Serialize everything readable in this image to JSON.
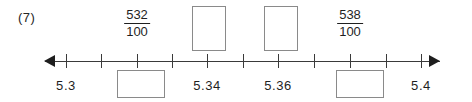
{
  "worksheet": {
    "problem_number": "(7)"
  },
  "number_line": {
    "axis": {
      "left_arrow_icon": "arrow-left-icon",
      "right_arrow_icon": "arrow-right-icon",
      "tick_count": 11,
      "start_value": "5.3",
      "end_value": "5.4",
      "tick_step": "0.01",
      "axis_color": "#3a3a3a"
    },
    "ticks": [
      {
        "index": 0,
        "x": 66
      },
      {
        "index": 1,
        "x": 101
      },
      {
        "index": 2,
        "x": 137
      },
      {
        "index": 3,
        "x": 172
      },
      {
        "index": 4,
        "x": 207
      },
      {
        "index": 5,
        "x": 243
      },
      {
        "index": 6,
        "x": 278
      },
      {
        "index": 7,
        "x": 314
      },
      {
        "index": 8,
        "x": 350
      },
      {
        "index": 9,
        "x": 386
      },
      {
        "index": 10,
        "x": 421
      }
    ],
    "labels_above": [
      {
        "type": "fraction",
        "numerator": "532",
        "denominator": "100",
        "x": 137
      },
      {
        "type": "fraction",
        "numerator": "538",
        "denominator": "100",
        "x": 350
      }
    ],
    "boxes_above": [
      {
        "x": 209
      },
      {
        "x": 281
      }
    ],
    "labels_below": [
      {
        "text": "5.3",
        "x": 66
      },
      {
        "text": "5.34",
        "x": 207
      },
      {
        "text": "5.36",
        "x": 278
      },
      {
        "text": "5.4",
        "x": 421
      }
    ],
    "boxes_below": [
      {
        "x": 141
      },
      {
        "x": 360
      }
    ]
  }
}
